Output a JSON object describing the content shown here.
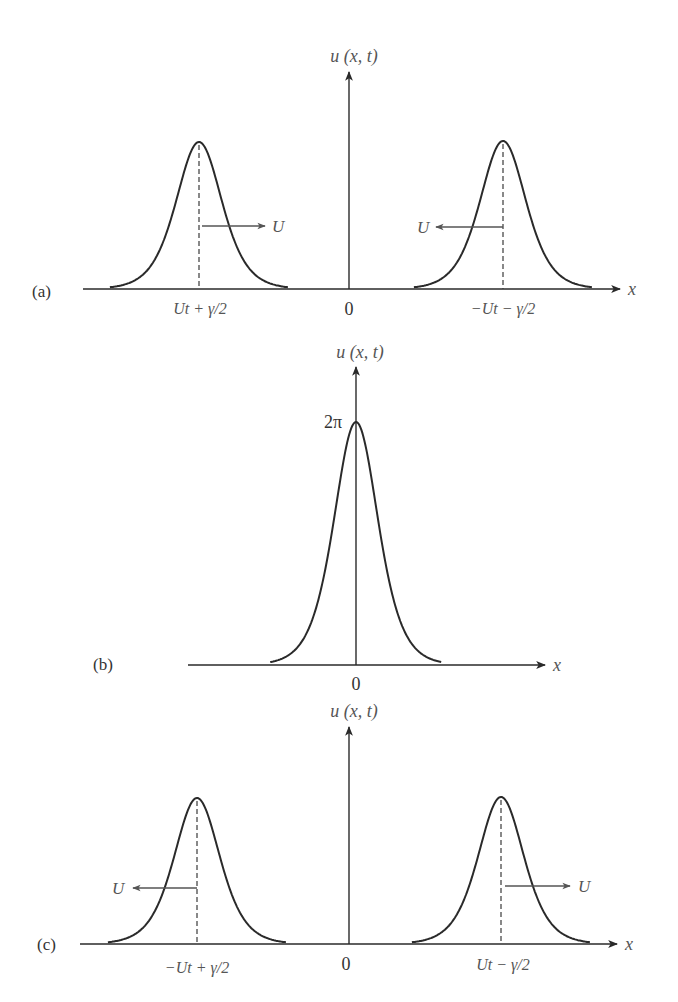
{
  "figure": {
    "panels": [
      {
        "id": "a",
        "label": "(a)",
        "ylabel": "u (x, t)",
        "xlabel": "x",
        "origin_label": "0",
        "geometry": {
          "baseline": 289,
          "axis_x": 349,
          "x_start": 83,
          "x_end": 620,
          "y_top": 72,
          "label_x": 32,
          "label_y": 297,
          "ylabel_y": 62
        },
        "pulses": [
          {
            "center": 199,
            "peak_y": 142,
            "halfwidth": 27,
            "x_label": "Ut + γ/2",
            "velocity_label": "U",
            "direction": "right",
            "arrow_y": 226,
            "arrow_to": 265,
            "u_x": 274
          },
          {
            "center": 503,
            "peak_y": 141,
            "halfwidth": 27,
            "x_label": "−Ut − γ/2",
            "velocity_label": "U",
            "direction": "left",
            "arrow_y": 227,
            "arrow_to": 436,
            "u_x": 424
          }
        ]
      },
      {
        "id": "b",
        "label": "(b)",
        "ylabel": "u (x, t)",
        "xlabel": "x",
        "origin_label": "0",
        "peak_value_label": "2π",
        "geometry": {
          "baseline": 665,
          "axis_x": 356,
          "x_start": 188,
          "x_end": 545,
          "y_top": 367,
          "label_x": 93,
          "label_y": 670,
          "ylabel_y": 358
        },
        "pulses": [
          {
            "center": 356,
            "peak_y": 422,
            "halfwidth": 26
          }
        ]
      },
      {
        "id": "c",
        "label": "(c)",
        "ylabel": "u (x, t)",
        "xlabel": "x",
        "origin_label": "0",
        "geometry": {
          "baseline": 944,
          "axis_x": 349,
          "x_start": 80,
          "x_end": 617,
          "y_top": 727,
          "label_x": 37,
          "label_y": 950,
          "ylabel_y": 717
        },
        "pulses": [
          {
            "center": 197,
            "peak_y": 798,
            "halfwidth": 27,
            "x_label": "−Ut + γ/2",
            "velocity_label": "U",
            "direction": "left",
            "arrow_y": 888,
            "arrow_to": 133,
            "u_x": 121
          },
          {
            "center": 501,
            "peak_y": 797,
            "halfwidth": 27,
            "x_label": "Ut − γ/2",
            "velocity_label": "U",
            "direction": "right",
            "arrow_y": 886,
            "arrow_to": 570,
            "u_x": 581
          }
        ]
      }
    ]
  }
}
